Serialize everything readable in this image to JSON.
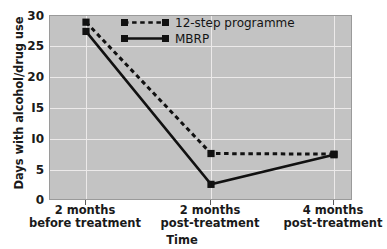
{
  "chart_data": {
    "type": "line",
    "title": "",
    "xlabel": "Time",
    "ylabel": "Days with alcohol/drug use",
    "categories": [
      "2 months before treatment",
      "2 months post-treatment",
      "4 months post-treatment"
    ],
    "category_lines": [
      [
        "2 months",
        "before treatment"
      ],
      [
        "2 months",
        "post-treatment"
      ],
      [
        "4 months",
        "post-treatment"
      ]
    ],
    "series": [
      {
        "name": "12-step programme",
        "values": [
          29,
          7.7,
          7.6
        ],
        "style": "dashed",
        "marker": "square",
        "color": "#111111"
      },
      {
        "name": "MBRP",
        "values": [
          27.5,
          2.7,
          7.5
        ],
        "style": "solid",
        "marker": "square",
        "color": "#111111"
      }
    ],
    "ylim": [
      0,
      30
    ],
    "yticks": [
      0,
      5,
      10,
      15,
      20,
      25,
      30
    ],
    "ytick_labels": [
      "0",
      "5",
      "I0",
      "I5",
      "20",
      "25",
      "30"
    ],
    "grid": true,
    "grid_color": "#eceaea",
    "plot_background": "#c3c3c3",
    "figure_background": "#ffffff",
    "legend_position": "upper-right-inside"
  }
}
